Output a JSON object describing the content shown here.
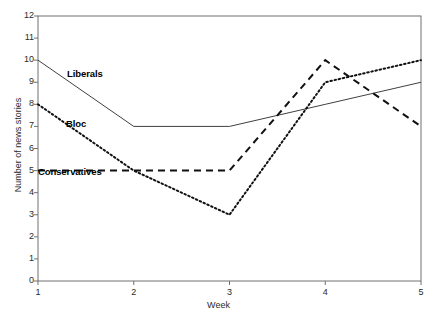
{
  "chart_data": {
    "type": "line",
    "title": "",
    "xlabel": "Week",
    "ylabel": "Number of news stories",
    "x": [
      1,
      2,
      3,
      4,
      5
    ],
    "xticklabels": [
      "1",
      "2",
      "3",
      "4",
      "5"
    ],
    "yticklabels": [
      "0",
      "1",
      "2",
      "3",
      "4",
      "5",
      "6",
      "7",
      "8",
      "9",
      "10",
      "11",
      "12"
    ],
    "xlim": [
      1,
      5
    ],
    "ylim": [
      0,
      12
    ],
    "grid": false,
    "legend": "inline-labels",
    "series": [
      {
        "name": "Liberals",
        "style": "solid",
        "color": "#404040",
        "values": [
          10,
          7,
          7,
          8,
          9
        ],
        "label_x": 67,
        "label_y": 68
      },
      {
        "name": "Bloc",
        "style": "dotted",
        "color": "#111111",
        "values": [
          8,
          5,
          3,
          9,
          10
        ],
        "label_x": 66,
        "label_y": 118
      },
      {
        "name": "Conservatives",
        "style": "dashed",
        "color": "#111111",
        "values": [
          5,
          5,
          5,
          10,
          7
        ],
        "label_x": 38,
        "label_y": 166
      }
    ]
  },
  "axis": {
    "x_title": "Week",
    "y_title": "Number of news stories"
  }
}
